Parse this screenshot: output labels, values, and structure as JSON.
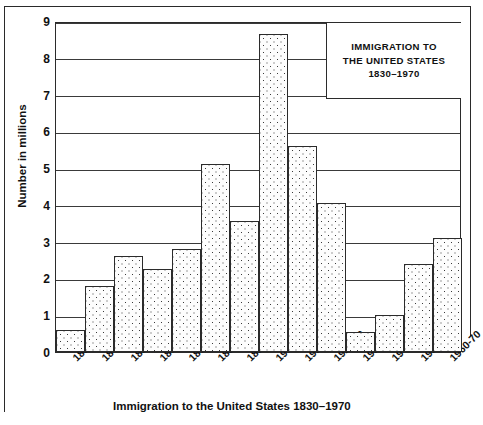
{
  "chart_data": {
    "type": "bar",
    "title_lines": [
      "IMMIGRATION TO",
      "THE UNITED STATES",
      "1830–1970"
    ],
    "xlabel": "Immigration to the United States 1830–1970",
    "ylabel": "Number in millions",
    "ylim": [
      0,
      9
    ],
    "yticks": [
      0,
      1,
      2,
      3,
      4,
      5,
      6,
      7,
      8,
      9
    ],
    "ytick_labels": [
      "0",
      "1",
      "2",
      "3",
      "4",
      "5",
      "6",
      "7",
      "8",
      "9"
    ],
    "grid": true,
    "legend": "none",
    "categories": [
      "1830-40",
      "1840-50",
      "1850-60",
      "1860-70",
      "1870-80",
      "1880-90",
      "1890-00",
      "1900-10",
      "1910-20",
      "1920-30",
      "1930-40",
      "1940-50",
      "1950-60",
      "1960-70"
    ],
    "values": [
      0.6,
      1.8,
      2.6,
      2.25,
      2.8,
      5.1,
      3.55,
      8.65,
      5.6,
      4.05,
      0.55,
      1.0,
      2.4,
      3.1
    ],
    "bar_style": "stippled-dots",
    "bar_fill": "#fdfdfd",
    "bar_edge": "#2b2b2b"
  },
  "axis": {
    "y_label": "Number in millions",
    "x_caption": "Immigration to the United States 1830–1970"
  }
}
